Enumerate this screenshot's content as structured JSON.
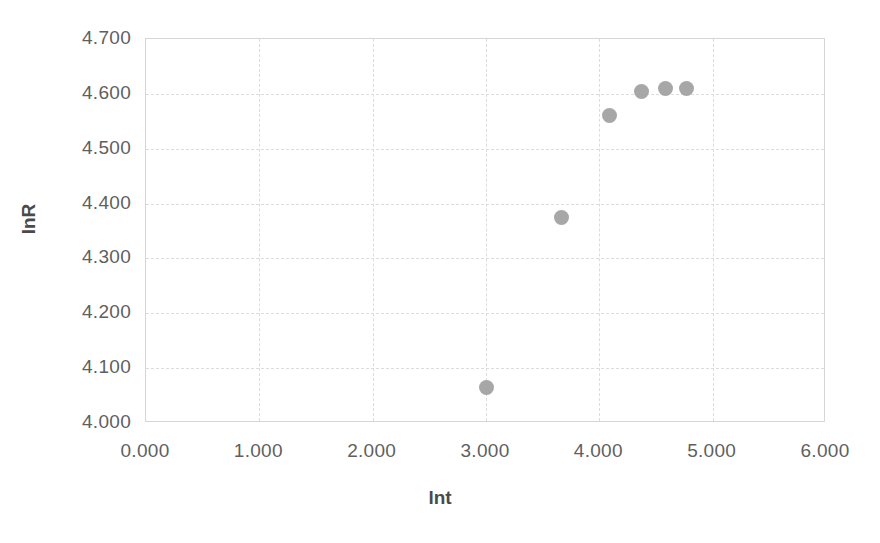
{
  "chart_data": {
    "type": "scatter",
    "title": "",
    "xlabel": "lnt",
    "ylabel": "lnR",
    "xlim": [
      0.0,
      6.0
    ],
    "ylim": [
      4.0,
      4.7
    ],
    "xticks": [
      "0.000",
      "1.000",
      "2.000",
      "3.000",
      "4.000",
      "5.000",
      "6.000"
    ],
    "xtick_values": [
      0.0,
      1.0,
      2.0,
      3.0,
      4.0,
      5.0,
      6.0
    ],
    "yticks": [
      "4.000",
      "4.100",
      "4.200",
      "4.300",
      "4.400",
      "4.500",
      "4.600",
      "4.700"
    ],
    "ytick_values": [
      4.0,
      4.1,
      4.2,
      4.3,
      4.4,
      4.5,
      4.6,
      4.7
    ],
    "grid": true,
    "legend": false,
    "marker_color": "#a0a0a0",
    "grid_color": "#dcdcdc",
    "axis_color": "#d6d6d6",
    "series": [
      {
        "name": "lnR vs lnt",
        "x": [
          3.0,
          3.67,
          4.09,
          4.37,
          4.58,
          4.77
        ],
        "y": [
          4.065,
          4.375,
          4.56,
          4.604,
          4.609,
          4.61
        ]
      }
    ]
  },
  "caption": ""
}
